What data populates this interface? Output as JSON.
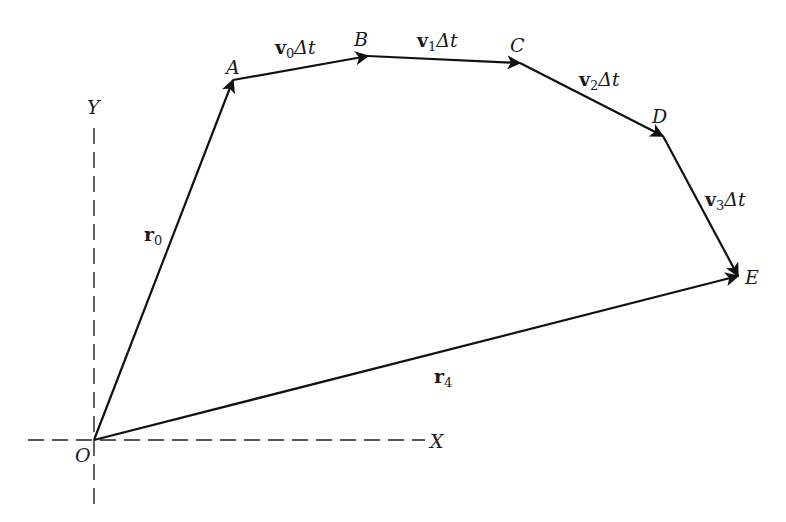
{
  "diagram": {
    "axes": {
      "x_label": "X",
      "y_label": "Y",
      "origin_label": "O",
      "style": "dashed"
    },
    "points": [
      {
        "id": "O",
        "label": "O",
        "x": 94,
        "y": 440
      },
      {
        "id": "A",
        "label": "A",
        "x": 233,
        "y": 80
      },
      {
        "id": "B",
        "label": "B",
        "x": 368,
        "y": 56
      },
      {
        "id": "C",
        "label": "C",
        "x": 520,
        "y": 63
      },
      {
        "id": "D",
        "label": "D",
        "x": 663,
        "y": 136
      },
      {
        "id": "E",
        "label": "E",
        "x": 738,
        "y": 276
      }
    ],
    "vectors": [
      {
        "name": "r0",
        "from": "O",
        "to": "A",
        "label_main": "r",
        "label_sub": "0",
        "label_suffix": ""
      },
      {
        "name": "v0dt",
        "from": "A",
        "to": "B",
        "label_main": "v",
        "label_sub": "0",
        "label_suffix": "Δt"
      },
      {
        "name": "v1dt",
        "from": "B",
        "to": "C",
        "label_main": "v",
        "label_sub": "1",
        "label_suffix": "Δt"
      },
      {
        "name": "v2dt",
        "from": "C",
        "to": "D",
        "label_main": "v",
        "label_sub": "2",
        "label_suffix": "Δt"
      },
      {
        "name": "v3dt",
        "from": "D",
        "to": "E",
        "label_main": "v",
        "label_sub": "3",
        "label_suffix": "Δt"
      },
      {
        "name": "r4",
        "from": "O",
        "to": "E",
        "label_main": "r",
        "label_sub": "4",
        "label_suffix": ""
      }
    ],
    "line_color": "#111111"
  }
}
